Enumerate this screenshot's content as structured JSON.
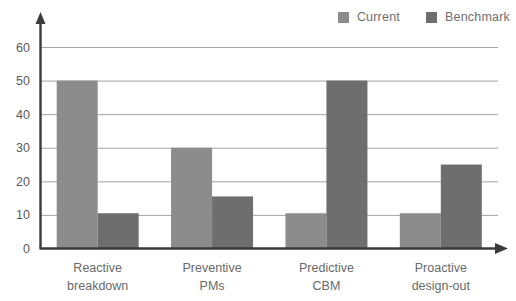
{
  "chart_data": {
    "type": "bar",
    "title": "",
    "subtitle": "",
    "xlabel": "",
    "ylabel": "",
    "categories": [
      "Reactive breakdown",
      "Preventive PMs",
      "Predictive CBM",
      "Proactive design-out"
    ],
    "category_lines": [
      [
        "Reactive",
        "breakdown"
      ],
      [
        "Preventive",
        "PMs"
      ],
      [
        "Predictive",
        "CBM"
      ],
      [
        "Proactive",
        "design-out"
      ]
    ],
    "series": [
      {
        "name": "Current",
        "color": "#8c8c8c",
        "values": [
          50,
          30,
          10.5,
          10.5
        ]
      },
      {
        "name": "Benchmark",
        "color": "#6e6e6e",
        "values": [
          10.5,
          15.5,
          50,
          25
        ]
      }
    ],
    "ylim": [
      0,
      65
    ],
    "yticks": [
      0,
      10,
      20,
      30,
      40,
      50,
      60
    ],
    "ytick_labels": [
      "0",
      "10",
      "20",
      "30",
      "40",
      "50",
      "60"
    ],
    "grid": true,
    "grid_axis": "y",
    "legend_position": "top-right",
    "axis_arrows": true
  },
  "legend": {
    "entries": [
      {
        "label": "Current",
        "color": "#8c8c8c"
      },
      {
        "label": "Benchmark",
        "color": "#6e6e6e"
      }
    ]
  }
}
